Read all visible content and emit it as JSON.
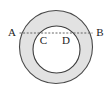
{
  "figure": {
    "type": "geometry-diagram",
    "name": "annulus-with-diameter-chord",
    "canvas": {
      "width": 112,
      "height": 101,
      "background": "#ffffff"
    },
    "shapes": {
      "outer_circle": {
        "name": "outer-circle",
        "cx": 56,
        "cy": 47,
        "r": 36.5,
        "fill": "#e2e2e2",
        "stroke": "#4a4a4a",
        "stroke_width": 1.1
      },
      "inner_circle": {
        "name": "inner-circle",
        "cx": 56.5,
        "cy": 49.5,
        "r": 23.5,
        "fill": "#ffffff",
        "stroke": "#3d3d3d",
        "stroke_width": 1.1
      },
      "chord": {
        "name": "dashed-chord-AB",
        "x1": 19.5,
        "y1": 33,
        "x2": 92.5,
        "y2": 33,
        "stroke": "#555555",
        "stroke_width": 0.9,
        "dash_pattern": "2,1.6"
      }
    },
    "labels": [
      {
        "id": "A",
        "text": "A",
        "x": 12,
        "y": 33,
        "position": "outside-left"
      },
      {
        "id": "B",
        "text": "B",
        "x": 100,
        "y": 33,
        "position": "outside-right"
      },
      {
        "id": "C",
        "text": "C",
        "x": 43.5,
        "y": 41,
        "position": "inside-left"
      },
      {
        "id": "D",
        "text": "D",
        "x": 66,
        "y": 41,
        "position": "inside-right"
      }
    ]
  }
}
